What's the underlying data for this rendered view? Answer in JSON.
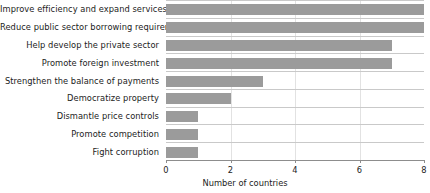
{
  "chart_data": {
    "type": "bar",
    "orientation": "horizontal",
    "title": "",
    "xlabel": "Number of countries",
    "ylabel": "",
    "xlim": [
      0,
      8
    ],
    "xticks": [
      0,
      2,
      4,
      6,
      8
    ],
    "xtick_labels": [
      "0",
      "2",
      "4",
      "6",
      "8"
    ],
    "grid": "vertical-faint-with-row-separators",
    "legend": "none",
    "bar_color": "#9b9b9b",
    "axis_color": "#8d8d8d",
    "gridline_color": "#e2e2e2",
    "rowline_color": "#c9c9c9",
    "background": "#ffffff",
    "categories": [
      "Improve efficiency and expand services",
      "Reduce public sector borrowing requirements",
      "Help develop the private sector",
      "Promote foreign investment",
      "Strengthen the balance of payments",
      "Democratize property",
      "Dismantle price controls",
      "Promote competition",
      "Fight corruption"
    ],
    "values": [
      8,
      8,
      7,
      7,
      3,
      2,
      1,
      1,
      1
    ]
  }
}
